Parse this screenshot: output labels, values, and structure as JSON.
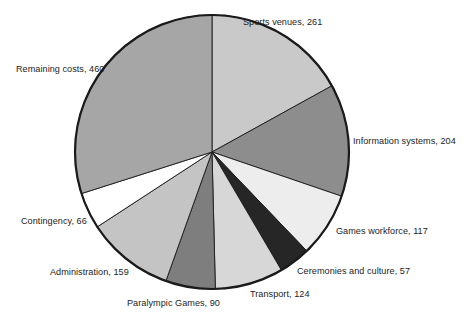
{
  "chart_data": {
    "type": "pie",
    "title": "",
    "subtitle": "",
    "xlabel": "",
    "ylabel": "",
    "legend_position": "none",
    "grid": false,
    "labels_position": "outside",
    "total": 1538,
    "units": "",
    "start_angle_deg": 0,
    "direction": "clockwise",
    "categories": [
      "Sports venues",
      "Information systems",
      "Games workforce",
      "Ceremonies and culture",
      "Transport",
      "Paralympic Games",
      "Administration",
      "Contingency",
      "Remaining costs"
    ],
    "values": [
      261,
      204,
      117,
      57,
      124,
      90,
      159,
      66,
      460
    ],
    "colors": [
      "#c9c9c9",
      "#8d8d8d",
      "#ededed",
      "#262626",
      "#d7d7d7",
      "#7e7e7e",
      "#c4c4c4",
      "#ffffff",
      "#a6a6a6"
    ],
    "slices": [
      {
        "label": "Sports venues",
        "value": 261,
        "label_text": "Sports venues, 261",
        "color": "#c9c9c9",
        "label_x": 243,
        "label_y": 17,
        "align": "left"
      },
      {
        "label": "Information systems",
        "value": 204,
        "label_text": "Information systems, 204",
        "color": "#8d8d8d",
        "label_x": 353,
        "label_y": 136,
        "align": "left"
      },
      {
        "label": "Games workforce",
        "value": 117,
        "label_text": "Games workforce, 117",
        "color": "#ededed",
        "label_x": 336,
        "label_y": 226,
        "align": "left"
      },
      {
        "label": "Ceremonies and culture",
        "value": 57,
        "label_text": "Ceremonies and culture, 57",
        "color": "#262626",
        "label_x": 297,
        "label_y": 266,
        "align": "left"
      },
      {
        "label": "Transport",
        "value": 124,
        "label_text": "Transport, 124",
        "color": "#d7d7d7",
        "label_x": 250,
        "label_y": 289,
        "align": "left"
      },
      {
        "label": "Paralympic Games",
        "value": 90,
        "label_text": "Paralympic Games, 90",
        "color": "#7e7e7e",
        "label_x": 127,
        "label_y": 298,
        "align": "left"
      },
      {
        "label": "Administration",
        "value": 159,
        "label_text": "Administration, 159",
        "color": "#c4c4c4",
        "label_x": 50,
        "label_y": 267,
        "align": "left"
      },
      {
        "label": "Contingency",
        "value": 66,
        "label_text": "Contingency, 66",
        "color": "#ffffff",
        "label_x": 21,
        "label_y": 216,
        "align": "left"
      },
      {
        "label": "Remaining costs",
        "value": 460,
        "label_text": "Remaining costs, 460",
        "color": "#a6a6a6",
        "label_x": 16,
        "label_y": 64,
        "align": "left"
      }
    ],
    "geometry": {
      "center_x": 212,
      "center_y": 152,
      "radius": 137
    }
  }
}
